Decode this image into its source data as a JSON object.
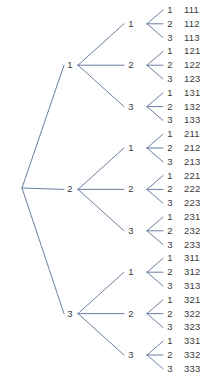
{
  "diagram": {
    "type": "tree",
    "line_color": "#5b6f99",
    "text_color": "#3b3b3b",
    "background_color": "#ffffff",
    "levels": 3,
    "branches_per_node": 3,
    "total_outcomes": 27,
    "root": {
      "label": ""
    },
    "level1": [
      {
        "id": "n1",
        "label": "1"
      },
      {
        "id": "n2",
        "label": "2"
      },
      {
        "id": "n3",
        "label": "3"
      }
    ],
    "level2": [
      {
        "id": "n11",
        "label": "1"
      },
      {
        "id": "n12",
        "label": "2"
      },
      {
        "id": "n13",
        "label": "3"
      },
      {
        "id": "n21",
        "label": "1"
      },
      {
        "id": "n22",
        "label": "2"
      },
      {
        "id": "n23",
        "label": "3"
      },
      {
        "id": "n31",
        "label": "1"
      },
      {
        "id": "n32",
        "label": "2"
      },
      {
        "id": "n33",
        "label": "3"
      }
    ],
    "level3": [
      {
        "branch": "1",
        "outcome": "111"
      },
      {
        "branch": "2",
        "outcome": "112"
      },
      {
        "branch": "3",
        "outcome": "113"
      },
      {
        "branch": "1",
        "outcome": "121"
      },
      {
        "branch": "2",
        "outcome": "122"
      },
      {
        "branch": "3",
        "outcome": "123"
      },
      {
        "branch": "1",
        "outcome": "131"
      },
      {
        "branch": "2",
        "outcome": "132"
      },
      {
        "branch": "3",
        "outcome": "133"
      },
      {
        "branch": "1",
        "outcome": "211"
      },
      {
        "branch": "2",
        "outcome": "212"
      },
      {
        "branch": "3",
        "outcome": "213"
      },
      {
        "branch": "1",
        "outcome": "221"
      },
      {
        "branch": "2",
        "outcome": "222"
      },
      {
        "branch": "3",
        "outcome": "223"
      },
      {
        "branch": "1",
        "outcome": "231"
      },
      {
        "branch": "2",
        "outcome": "232"
      },
      {
        "branch": "3",
        "outcome": "233"
      },
      {
        "branch": "1",
        "outcome": "311"
      },
      {
        "branch": "2",
        "outcome": "312"
      },
      {
        "branch": "3",
        "outcome": "313"
      },
      {
        "branch": "1",
        "outcome": "321"
      },
      {
        "branch": "2",
        "outcome": "322"
      },
      {
        "branch": "3",
        "outcome": "323"
      },
      {
        "branch": "1",
        "outcome": "331"
      },
      {
        "branch": "2",
        "outcome": "332"
      },
      {
        "branch": "3",
        "outcome": "333"
      }
    ]
  },
  "geometry": {
    "width": 212,
    "height": 377,
    "root_x": 22,
    "root_y": 188,
    "level1_label_x": 70,
    "level1_node_x": 78,
    "level2_label_x": 131,
    "level2_node_x": 147,
    "level3_label_x": 170,
    "leaf_tip_x": 163,
    "outcome_x": 184,
    "leaf_top_y": 10,
    "leaf_step_y": 13.8
  }
}
